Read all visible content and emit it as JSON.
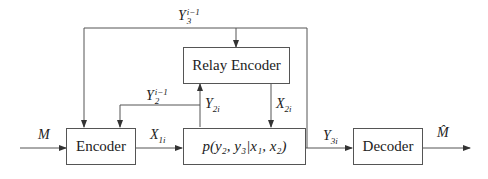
{
  "diagram": {
    "type": "block-diagram",
    "title": "",
    "blocks": {
      "encoder": "Encoder",
      "relay_encoder": "Relay Encoder",
      "channel": "p(y₂, y₃|x₁, x₂)",
      "decoder": "Decoder"
    },
    "signals": {
      "input": {
        "base": "M"
      },
      "x1": {
        "base": "X",
        "sub": "1i"
      },
      "x2": {
        "base": "X",
        "sub": "2i"
      },
      "y2": {
        "base": "Y",
        "sub": "2i"
      },
      "y3": {
        "base": "Y",
        "sub": "3i"
      },
      "y2_past": {
        "base": "Y",
        "sub": "2",
        "sup": "i−1"
      },
      "y3_past": {
        "base": "Y",
        "sub": "3",
        "sup": "i−1"
      },
      "output": {
        "base": "M̂"
      }
    },
    "edges": [
      {
        "from": "input",
        "to": "encoder",
        "label": "M"
      },
      {
        "from": "encoder",
        "to": "channel",
        "label": "X1i"
      },
      {
        "from": "relay_encoder",
        "to": "channel",
        "label": "X2i"
      },
      {
        "from": "channel",
        "to": "relay_encoder",
        "label": "Y2i"
      },
      {
        "from": "channel",
        "to": "encoder",
        "label": "Y2^(i-1)"
      },
      {
        "from": "channel",
        "to": "decoder",
        "label": "Y3i"
      },
      {
        "from": "channel",
        "to": "encoder",
        "label": "Y3^(i-1)"
      },
      {
        "from": "channel",
        "to": "relay_encoder",
        "label": "Y3^(i-1)"
      },
      {
        "from": "decoder",
        "to": "output",
        "label": "M̂"
      }
    ],
    "colors": {
      "line": "#555555",
      "text": "#222222",
      "background": "#ffffff"
    }
  }
}
